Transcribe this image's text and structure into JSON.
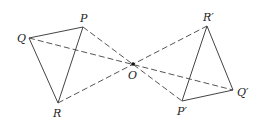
{
  "diagram": {
    "center": {
      "name": "O",
      "label": "O",
      "x": 133,
      "y": 64
    },
    "triangle_original": {
      "vertices": [
        {
          "name": "P",
          "label": "P",
          "x": 83,
          "y": 27
        },
        {
          "name": "Q",
          "label": "Q",
          "x": 29,
          "y": 38
        },
        {
          "name": "R",
          "label": "R",
          "x": 58,
          "y": 103
        }
      ]
    },
    "triangle_image": {
      "vertices": [
        {
          "name": "P'",
          "label": "P′",
          "x": 182,
          "y": 101
        },
        {
          "name": "Q'",
          "label": "Q′",
          "x": 233,
          "y": 90
        },
        {
          "name": "R'",
          "label": "R′",
          "x": 207,
          "y": 26
        }
      ]
    },
    "construction_lines": [
      {
        "from": "P",
        "to": "P'",
        "style": "dashed"
      },
      {
        "from": "Q",
        "to": "Q'",
        "style": "dashed"
      },
      {
        "from": "R",
        "to": "R'",
        "style": "dashed"
      }
    ],
    "colors": {
      "line": "#444444",
      "dashed": "#555555",
      "text": "#222222",
      "point": "#111111"
    }
  }
}
